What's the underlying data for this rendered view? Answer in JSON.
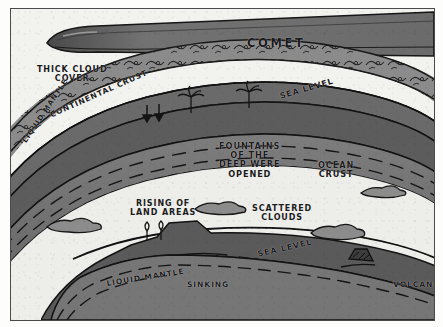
{
  "figure": {
    "background_color": "#f2f2ef",
    "ink_color": "#1a1a1a",
    "frame_color": "#4a4a4a"
  },
  "palette": {
    "comet_body": "#6e6e6e",
    "comet_outline": "#1f1f1f",
    "cloud_band": "#8b8b8b",
    "continental_crust": "#5f5f5f",
    "ocean_crust": "#5a5a5a",
    "liquid_mantle": "#747474",
    "interior": "#ededea",
    "sea_water": "#6a6a6a"
  },
  "labels": [
    {
      "name": "comet",
      "text": "COMET",
      "x": 236,
      "y": 28,
      "size": 11.5,
      "rotate": 0
    },
    {
      "name": "thick-cloud-cover",
      "text": "THICK CLOUD\nCOVER",
      "x": 26,
      "y": 57,
      "size": 8.0,
      "rotate": 0
    },
    {
      "name": "sea-level-upper",
      "text": "SEA LEVEL",
      "x": 268,
      "y": 84,
      "size": 8.0,
      "rotate": -16
    },
    {
      "name": "continental-crust",
      "text": "CONTINENTAL CRUST",
      "x": 38,
      "y": 103,
      "size": 7.6,
      "rotate": -24
    },
    {
      "name": "liquid-mantle-upper",
      "text": "LIQUID MANTLE",
      "x": 10,
      "y": 131,
      "size": 7.2,
      "rotate": -56
    },
    {
      "name": "fountains-of-the-deep",
      "text": "FOUNTAINS\nOF THE\nDEEP WERE\nOPENED",
      "x": 208,
      "y": 133,
      "size": 8.2,
      "rotate": 0
    },
    {
      "name": "ocean-crust",
      "text": "OCEAN\nCRUST",
      "x": 307,
      "y": 152,
      "size": 8.2,
      "rotate": 0
    },
    {
      "name": "rising-of-land-areas",
      "text": "RISING OF\nLAND AREAS",
      "x": 119,
      "y": 191,
      "size": 8.0,
      "rotate": 0
    },
    {
      "name": "scattered-clouds",
      "text": "SCATTERED\nCLOUDS",
      "x": 241,
      "y": 196,
      "size": 8.0,
      "rotate": 0
    },
    {
      "name": "sea-level-lower",
      "text": "SEA LEVEL",
      "x": 246,
      "y": 242,
      "size": 8.0,
      "rotate": -13
    },
    {
      "name": "liquid-mantle-lower",
      "text": "LIQUID MANTLE",
      "x": 95,
      "y": 271,
      "size": 7.6,
      "rotate": -9
    },
    {
      "name": "sinking",
      "text": "SINKING",
      "x": 176,
      "y": 272,
      "size": 7.6,
      "rotate": 0
    },
    {
      "name": "volcano",
      "text": "VOLCANO",
      "x": 382,
      "y": 272,
      "size": 7.6,
      "rotate": 0
    }
  ],
  "features": {
    "palm_trees_upper": 2,
    "trees_lower": 2,
    "cloud_puffs_lower": 4,
    "volcano_count": 1,
    "fountain_arrows": 2
  }
}
